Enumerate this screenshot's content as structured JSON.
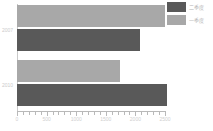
{
  "chart_data": {
    "type": "bar",
    "orientation": "horizontal",
    "title": "",
    "xlabel": "",
    "ylabel": "",
    "categories": [
      "2007",
      "2010"
    ],
    "series": [
      {
        "name": "二季度",
        "color": "#595959",
        "values": [
          2080,
          2540
        ]
      },
      {
        "name": "一季度",
        "color": "#a8a8a8",
        "values": [
          2500,
          1740
        ]
      }
    ],
    "xlim": [
      0,
      2500
    ],
    "xticks": [
      0,
      500,
      1000,
      1500,
      2000,
      2500
    ],
    "xtick_labels": [
      "0",
      "500",
      "1000",
      "1500",
      "2000",
      "2500"
    ],
    "grid": false,
    "legend_position": "top-right"
  },
  "legend": {
    "entries": [
      {
        "label": "二季度",
        "color": "#595959"
      },
      {
        "label": "一季度",
        "color": "#a8a8a8"
      }
    ]
  },
  "axis": {
    "x_labels": [
      "0",
      "500",
      "1000",
      "1500",
      "2000",
      "2500"
    ],
    "y_labels": [
      "2007",
      "2010"
    ]
  },
  "colors": {
    "series_dark": "#595959",
    "series_light": "#a8a8a8",
    "axis": "#b9b9b9",
    "text": "#c6c6c6",
    "background": "#ffffff"
  }
}
